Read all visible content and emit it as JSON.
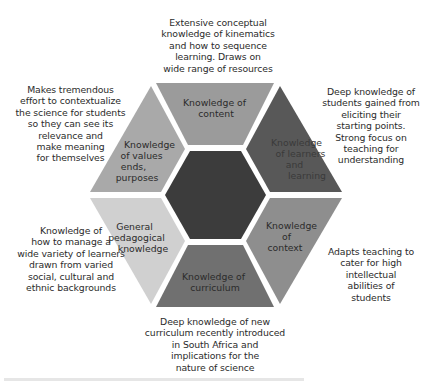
{
  "diagram": {
    "type": "hexagon-ring",
    "colors": {
      "center": "#3c3c3c",
      "gap": "#ffffff",
      "content": "#9b9b9b",
      "learners": "#585858",
      "context": "#8e8e8e",
      "curriculum": "#707070",
      "general_pedagogical": "#d0d0d0",
      "values": "#a9a9a9"
    },
    "segments": [
      {
        "id": "content",
        "label_lines": [
          "Knowledge of",
          "content"
        ],
        "note": "Extensive conceptual\nknowledge of kinematics\nand how to sequence\nlearning. Draws on\nwide range of resources"
      },
      {
        "id": "learners",
        "label_lines": [
          "Knowledge",
          "of learners",
          "and",
          "learning"
        ],
        "note": "Deep knowledge of\nstudents gained from\neliciting their\nstarting points.\nStrong focus on\nteaching for\nunderstanding"
      },
      {
        "id": "context",
        "label_lines": [
          "Knowledge",
          "of",
          "context"
        ],
        "note": "Adapts teaching to\ncater for high\nintellectual\nabilities of\nstudents"
      },
      {
        "id": "curriculum",
        "label_lines": [
          "Knowledge of",
          "curriculum"
        ],
        "note": "Deep knowledge of new\ncurriculum recently introduced\nin South Africa and\nimplications for the\nnature of science"
      },
      {
        "id": "general_pedagogical",
        "label_lines": [
          "General",
          "pedagogical",
          "knowledge"
        ],
        "note": "Knowledge of\nhow to manage a\nwide variety of learners\ndrawn from varied\nsocial, cultural and\nethnic backgrounds"
      },
      {
        "id": "values",
        "label_lines": [
          "Knowledge",
          "of values",
          "ends,",
          "purposes"
        ],
        "note": "Makes tremendous\neffort to contextualize\nthe science for students\nso they can see its\nrelevance and\nmake meaning\nfor themselves"
      }
    ]
  }
}
